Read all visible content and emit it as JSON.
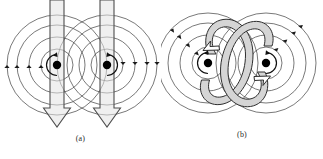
{
  "figure": {
    "type": "diagram",
    "background_color": "#ffffff",
    "line_color": "#3a3a3a",
    "arrow_fill_color": "#d8d8d8",
    "arrow_stroke_color": "#4a4a4a",
    "dot_color": "#000000"
  },
  "panels": [
    {
      "id": "a",
      "caption": "(a)",
      "conductors": [
        {
          "name": "left-conductor",
          "center_x": 57,
          "center_y": 65,
          "current_direction": "down",
          "field_circle_radii": [
            14,
            28,
            42,
            56
          ],
          "field_arrowheads": 4,
          "rotation_marker": "counterclockwise"
        },
        {
          "name": "right-conductor",
          "center_x": 107,
          "center_y": 65,
          "current_direction": "down",
          "field_circle_radii": [
            14,
            28,
            42,
            56
          ],
          "field_arrowheads": 4,
          "rotation_marker": "counterclockwise"
        }
      ]
    },
    {
      "id": "b",
      "caption": "(b)",
      "conductors": [
        {
          "name": "left-conductor",
          "center_x": 44,
          "center_y": 62,
          "current_direction": "out-of-page",
          "field_circle_radii": [
            14,
            28,
            42,
            56
          ],
          "field_arrowheads": 4,
          "rotation_marker": "clockwise"
        },
        {
          "name": "right-conductor",
          "center_x": 102,
          "center_y": 62,
          "current_direction": "out-of-page",
          "field_circle_radii": [
            14,
            28,
            42,
            56
          ],
          "field_arrowheads": 4,
          "rotation_marker": "clockwise"
        }
      ],
      "loop_arrows": [
        {
          "name": "left-loop-arrow",
          "shape": "ellipse",
          "direction": "clockwise"
        },
        {
          "name": "right-loop-arrow",
          "shape": "ellipse",
          "direction": "clockwise"
        }
      ]
    }
  ]
}
